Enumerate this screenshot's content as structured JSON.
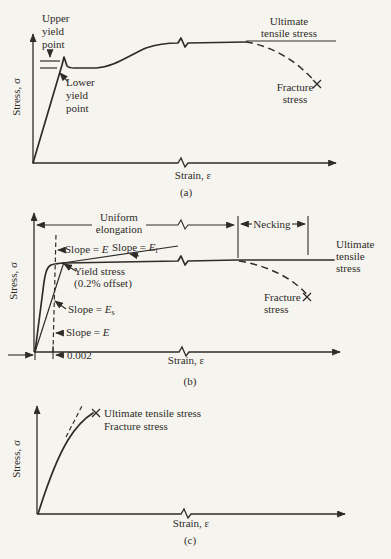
{
  "colors": {
    "ink": "#2e2c29",
    "paper": "#f6f4ef"
  },
  "panel_a": {
    "caption": "(a)",
    "y_axis": "Stress, σ",
    "x_axis": "Strain, ε",
    "upper_yield": [
      "Upper",
      "yield",
      "point"
    ],
    "lower_yield": [
      "Lower",
      "yield",
      "point"
    ],
    "ultimate": [
      "Ultimate",
      "tensile stress"
    ],
    "fracture": [
      "Fracture",
      "stress"
    ]
  },
  "panel_b": {
    "caption": "(b)",
    "y_axis": "Stress, σ",
    "x_axis": "Strain, ε",
    "uniform_elongation": [
      "Uniform",
      "elongation"
    ],
    "necking": "Necking",
    "slope_e_upper": {
      "prefix": "Slope = ",
      "symbol": "E"
    },
    "slope_et": {
      "prefix": "Slope = ",
      "symbol": "E",
      "sub": "t"
    },
    "slope_es": {
      "prefix": "Slope = ",
      "symbol": "E",
      "sub": "s"
    },
    "slope_e_lower": {
      "prefix": "Slope = ",
      "symbol": "E"
    },
    "yield_stress": [
      "Yield stress",
      "(0.2% offset)"
    ],
    "offset": "0.002",
    "ultimate": [
      "Ultimate",
      "tensile",
      "stress"
    ],
    "fracture": [
      "Fracture",
      "stress"
    ]
  },
  "panel_c": {
    "caption": "(c)",
    "y_axis": "Stress, σ",
    "x_axis": "Strain, ε",
    "ultimate": "Ultimate tensile stress",
    "fracture": "Fracture stress"
  }
}
